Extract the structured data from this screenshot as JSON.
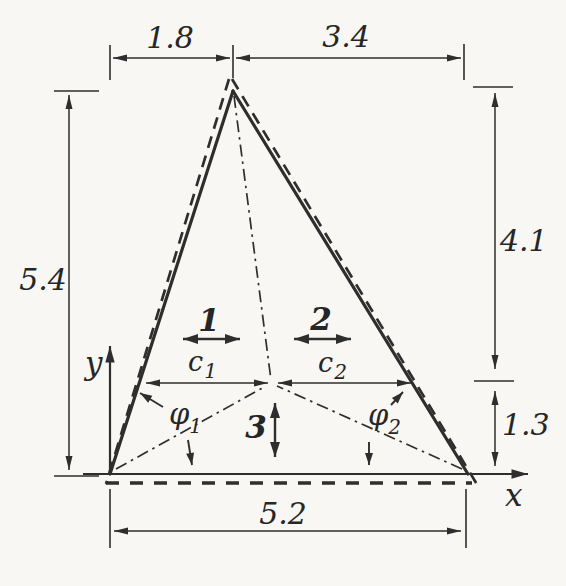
{
  "diagram": {
    "dimensions": {
      "top_left": "1.8",
      "top_right": "3.4",
      "left_height": "5.4",
      "right_upper": "4.1",
      "right_lower": "1.3",
      "bottom_width": "5.2"
    },
    "axes": {
      "x": "x",
      "y": "y"
    },
    "regions": {
      "r1": "1",
      "r2": "2",
      "r3": "3"
    },
    "c1": {
      "base": "c",
      "sub": "1"
    },
    "c2": {
      "base": "c",
      "sub": "2"
    },
    "phi1": {
      "base": "φ",
      "sub": "1"
    },
    "phi2": {
      "base": "φ",
      "sub": "2"
    }
  }
}
